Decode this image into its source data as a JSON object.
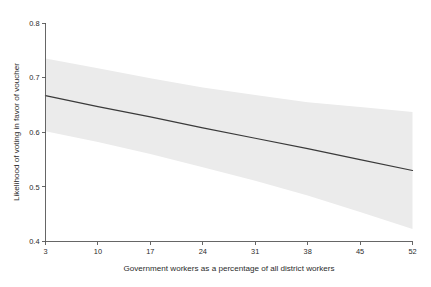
{
  "chart_data": {
    "type": "line",
    "title": "",
    "subtitle": "",
    "xlabel": "Government workers as a percentage of all district workers",
    "ylabel": "Likelihood of voting in favor of voucher",
    "xlim": [
      3,
      52
    ],
    "ylim": [
      0.4,
      0.8
    ],
    "xticks": [
      3,
      10,
      17,
      24,
      31,
      38,
      45,
      52
    ],
    "xtick_labels": [
      "3",
      "10",
      "17",
      "24",
      "31",
      "38",
      "45",
      "52"
    ],
    "yticks": [
      0.4,
      0.5,
      0.6,
      0.7,
      0.8
    ],
    "ytick_labels": [
      "0.4",
      "0.5",
      "0.6",
      "0.7",
      "0.8"
    ],
    "grid": false,
    "legend": null,
    "legend_position": "none",
    "series": [
      {
        "name": "Predicted likelihood of voting in favor of voucher",
        "style": "solid-line",
        "color": "#3a3a3a",
        "x": [
          3,
          10,
          17,
          24,
          31,
          38,
          45,
          52
        ],
        "values": [
          0.667,
          0.647,
          0.628,
          0.608,
          0.589,
          0.57,
          0.55,
          0.53
        ]
      }
    ],
    "confidence_band": {
      "name": "95% confidence interval",
      "color": "#ebebeb",
      "x": [
        3,
        10,
        17,
        24,
        31,
        38,
        45,
        52
      ],
      "upper": [
        0.735,
        0.717,
        0.699,
        0.682,
        0.668,
        0.655,
        0.646,
        0.637
      ],
      "lower": [
        0.602,
        0.582,
        0.56,
        0.536,
        0.511,
        0.484,
        0.454,
        0.423
      ]
    },
    "annotations": []
  }
}
